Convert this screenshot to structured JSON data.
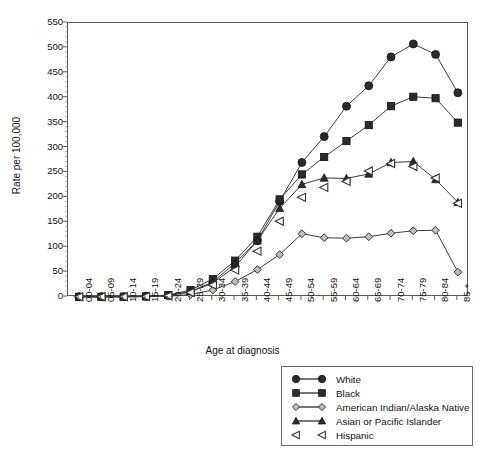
{
  "chart_data": {
    "type": "line",
    "title": "",
    "xlabel": "Age at diagnosis",
    "ylabel": "Rate per 100,000",
    "ylim": [
      0,
      550
    ],
    "ytick_step": 50,
    "yticks": [
      0,
      50,
      100,
      150,
      200,
      250,
      300,
      350,
      400,
      450,
      500,
      550
    ],
    "grid": false,
    "legend_position": "below-right",
    "categories": [
      "00-04",
      "05-09",
      "10-14",
      "15-19",
      "20-24",
      "25-29",
      "30-34",
      "35-39",
      "40-44",
      "45-49",
      "50-54",
      "55-59",
      "60-64",
      "65-69",
      "70-74",
      "75-79",
      "80-84",
      "85 +"
    ],
    "series": [
      {
        "name": "White",
        "marker": "circle-filled",
        "line": true,
        "values": [
          0.4,
          0.5,
          0.6,
          1.2,
          3.0,
          10.0,
          28.0,
          61.0,
          113.0,
          192.0,
          270.0,
          322.0,
          383.0,
          424.0,
          482.0,
          508.0,
          487.0,
          410.0
        ]
      },
      {
        "name": "Black",
        "marker": "square-filled",
        "line": true,
        "values": [
          0.4,
          0.5,
          0.7,
          1.4,
          4.0,
          14.0,
          36.0,
          73.0,
          121.0,
          196.0,
          246.0,
          281.0,
          313.0,
          345.0,
          383.0,
          402.0,
          399.0,
          350.0
        ]
      },
      {
        "name": "American Indian/Alaska Native",
        "marker": "diamond-open",
        "line": true,
        "values": [
          0.2,
          0.3,
          0.3,
          0.6,
          1.5,
          5.0,
          14.0,
          31.0,
          55.0,
          85.0,
          127.0,
          119.0,
          118.0,
          121.0,
          128.0,
          133.0,
          134.0,
          50.0
        ]
      },
      {
        "name": "Asian or Pacific  Islander",
        "marker": "triangle-filled",
        "line": true,
        "values": [
          0.3,
          0.4,
          0.5,
          1.0,
          3.0,
          11.0,
          30.0,
          68.0,
          113.0,
          178.0,
          226.0,
          239.0,
          238.0,
          247.0,
          270.0,
          272.0,
          236.0,
          190.0
        ]
      },
      {
        "name": "Hispanic",
        "marker": "triangle-left-open",
        "line": false,
        "values": [
          0.3,
          0.4,
          0.4,
          0.9,
          2.5,
          9.0,
          24.0,
          54.0,
          92.0,
          152.0,
          200.0,
          220.0,
          232.0,
          253.0,
          268.0,
          262.0,
          239.0,
          188.0
        ]
      }
    ]
  },
  "axes": {
    "y_label": "Rate per 100,000",
    "x_label": "Age at diagnosis"
  },
  "legend": {
    "entries": [
      {
        "label": "White"
      },
      {
        "label": "Black"
      },
      {
        "label": "American Indian/Alaska Native"
      },
      {
        "label": "Asian or Pacific  Islander"
      },
      {
        "label": "Hispanic"
      }
    ]
  },
  "style": {
    "line_color": "#3b3b3b",
    "marker_fill_dark": "#2b2b2b",
    "marker_fill_open": "#ffffff",
    "frame_color": "#5a5a5a"
  }
}
